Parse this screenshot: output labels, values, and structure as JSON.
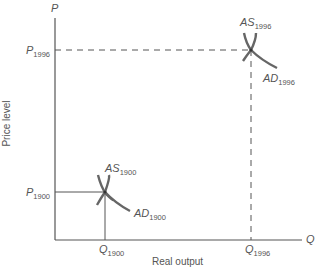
{
  "diagram": {
    "type": "AS-AD diagram",
    "y_axis": {
      "symbol": "P",
      "title": "Price level"
    },
    "x_axis": {
      "symbol": "Q",
      "title": "Real output"
    },
    "equilibria": [
      {
        "year": "1900",
        "as_label": "AS",
        "ad_label": "AD",
        "p_label": "P",
        "q_label": "Q",
        "line_style": "solid"
      },
      {
        "year": "1996",
        "as_label": "AS",
        "ad_label": "AD",
        "p_label": "P",
        "q_label": "Q",
        "line_style": "dashed"
      }
    ],
    "colors": {
      "axis": "#555555",
      "curve": "#666666",
      "text": "#555555"
    }
  }
}
